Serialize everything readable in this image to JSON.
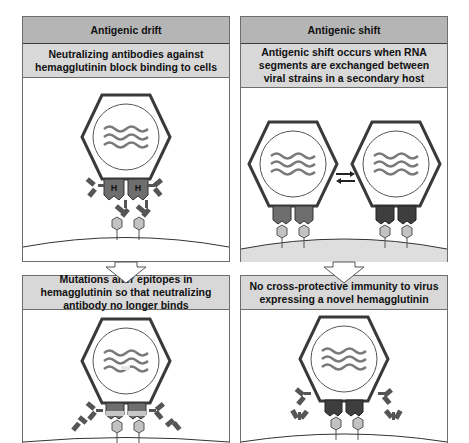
{
  "panels": {
    "drift": {
      "title": "Antigenic drift",
      "description": "Neutralizing antibodies against hemagglutinin block binding to cells",
      "hemagglutinin_label_left": "H",
      "hemagglutinin_label_right": "H"
    },
    "shift": {
      "title": "Antigenic shift",
      "description": "Antigenic shift occurs when RNA segments are exchanged between viral strains in a secondary host"
    },
    "drift_result": {
      "description": "Mutations alter epitopes in hemagglutinin so that neutralizing antibody no longer binds"
    },
    "shift_result": {
      "description": "No cross-protective immunity to virus expressing a novel hemagglutinin"
    }
  },
  "colors": {
    "header_bg": "#b5b5b5",
    "subheader_bg": "#d8d8d8",
    "hemagglutinin_drift": "#6e6e6e",
    "hemagglutinin_shift_a": "#6e6e6e",
    "hemagglutinin_shift_b": "#3e3e3e",
    "mutated_epitope": "#c8c8c8",
    "receptor": "#c2c2c2",
    "host_cell_shift": "#dedede"
  }
}
